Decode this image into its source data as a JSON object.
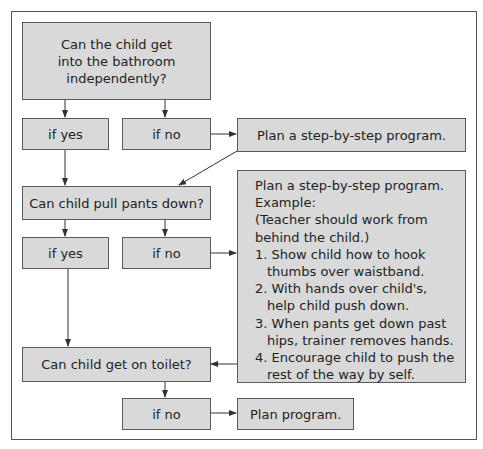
{
  "diagram": {
    "type": "flowchart",
    "nodes": {
      "q1": "Can the child get into the bathroom independently?",
      "q1_lines": [
        "Can the child get",
        "into the bathroom",
        "independently?"
      ],
      "q1_yes": "if yes",
      "q1_no": "if no",
      "plan1": "Plan a step-by-step program.",
      "q2": "Can child pull pants down?",
      "q2_yes": "if yes",
      "q2_no": "if no",
      "plan2": {
        "title": "Plan a step-by-step program.",
        "example": "Example:",
        "note_lines": [
          "(Teacher should work from",
          "behind the child.)"
        ],
        "steps": [
          "1. Show child how to hook thumbs over waistband.",
          "2. With hands over child's, help child push down.",
          "3. When pants get down past hips, trainer removes hands.",
          "4. Encourage child to push the rest of the way by self."
        ]
      },
      "q3": "Can child get on toilet?",
      "q3_no": "if no",
      "plan3": "Plan program."
    },
    "edges": [
      [
        "q1",
        "q1_yes"
      ],
      [
        "q1",
        "q1_no"
      ],
      [
        "q1_no",
        "plan1"
      ],
      [
        "plan1",
        "q2"
      ],
      [
        "q1_yes",
        "q2"
      ],
      [
        "q2",
        "q2_yes"
      ],
      [
        "q2",
        "q2_no"
      ],
      [
        "q2_no",
        "plan2"
      ],
      [
        "q2_yes",
        "q3"
      ],
      [
        "plan2",
        "q3"
      ],
      [
        "q3",
        "q3_no"
      ],
      [
        "q3_no",
        "plan3"
      ]
    ],
    "colors": {
      "box_fill": "#d9d9d9",
      "border": "#5a5a5a",
      "text": "#222222"
    }
  }
}
